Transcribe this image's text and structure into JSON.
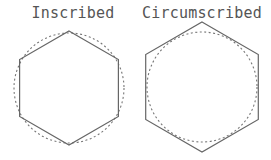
{
  "diagram": {
    "figures": [
      {
        "label": "Inscribed",
        "label_x": 73,
        "label_y": 18,
        "circle": {
          "cx": 69,
          "cy": 88,
          "r": 55
        },
        "hexagon": {
          "cx": 69,
          "cy": 88,
          "r": 57
        }
      },
      {
        "label": "Circumscribed",
        "label_x": 202,
        "label_y": 18,
        "circle": {
          "cx": 202,
          "cy": 87,
          "r": 55
        },
        "hexagon": {
          "cx": 202,
          "cy": 87,
          "r": 65
        }
      }
    ],
    "colors": {
      "stroke": "#666666",
      "text": "#555555",
      "background": "#ffffff"
    }
  }
}
